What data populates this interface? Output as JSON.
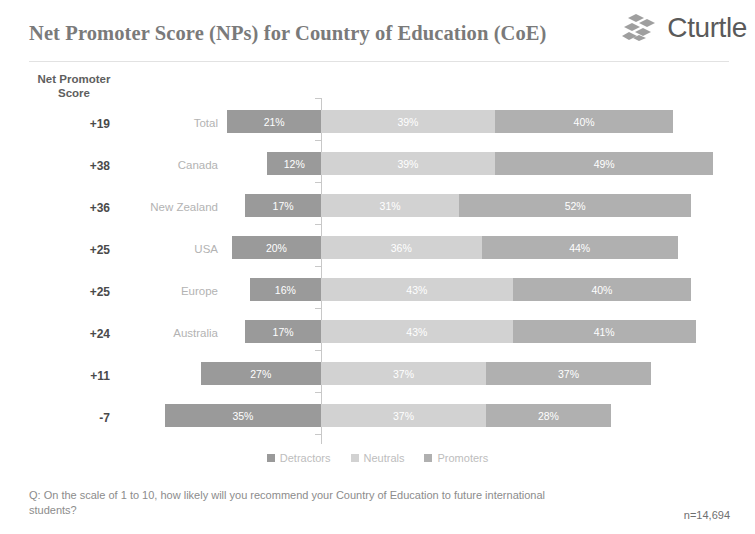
{
  "header": {
    "title": "Net Promoter Score (NPs) for Country of Education (CoE)",
    "logo_text": "Cturtle",
    "logo_icon": "diamond-cluster-icon"
  },
  "axis_caption": "Net Promoter\nScore",
  "footer": {
    "question": "Q: On the scale of 1 to 10, how likely will you recommend your Country of Education to future international students?",
    "sample_size": "n=14,694"
  },
  "colors": {
    "detractors": "#9a9a9a",
    "neutrals": "#d2d2d2",
    "promoters": "#b0b0b0",
    "axis": "#c8c8c8",
    "title": "#7a7a7a",
    "row_label": "#b3b3b3",
    "score": "#4a4a4a"
  },
  "chart_data": {
    "type": "bar",
    "subtype": "diverging-stacked-bar",
    "title": "Net Promoter Score (NPs) for Country of Education (CoE)",
    "xlabel": "",
    "ylabel": "Net Promoter Score",
    "grid": false,
    "legend_position": "bottom",
    "xlim": [
      -40,
      55
    ],
    "axis_origin": "Detractors extend left of zero line; Neutrals and Promoters extend right",
    "categories": [
      "Total",
      "Canada",
      "New Zealand",
      "USA",
      "Europe",
      "Australia",
      "UK",
      "Other"
    ],
    "nps_scores": [
      "+19",
      "+38",
      "+36",
      "+25",
      "+25",
      "+24",
      "+11",
      "-7"
    ],
    "series": [
      {
        "name": "Detractors",
        "color": "#9a9a9a",
        "values": [
          21,
          12,
          17,
          20,
          16,
          17,
          27,
          35
        ],
        "labels": [
          "21%",
          "12%",
          "17%",
          "20%",
          "16%",
          "17%",
          "27%",
          "35%"
        ]
      },
      {
        "name": "Neutrals",
        "color": "#d2d2d2",
        "values": [
          39,
          39,
          31,
          36,
          43,
          43,
          37,
          37
        ],
        "labels": [
          "39%",
          "39%",
          "31%",
          "36%",
          "43%",
          "43%",
          "37%",
          "37%"
        ]
      },
      {
        "name": "Promoters",
        "color": "#b0b0b0",
        "values": [
          40,
          49,
          52,
          44,
          40,
          41,
          37,
          28
        ],
        "labels": [
          "40%",
          "49%",
          "52%",
          "44%",
          "40%",
          "41%",
          "37%",
          "28%"
        ]
      }
    ],
    "rows": [
      {
        "score": "+19",
        "label": "Total",
        "detractors": 21,
        "neutrals": 39,
        "promoters": 40,
        "detractors_label": "21%",
        "neutrals_label": "39%",
        "promoters_label": "40%"
      },
      {
        "score": "+38",
        "label": "Canada",
        "detractors": 12,
        "neutrals": 39,
        "promoters": 49,
        "detractors_label": "12%",
        "neutrals_label": "39%",
        "promoters_label": "49%"
      },
      {
        "score": "+36",
        "label": "New Zealand",
        "detractors": 17,
        "neutrals": 31,
        "promoters": 52,
        "detractors_label": "17%",
        "neutrals_label": "31%",
        "promoters_label": "52%"
      },
      {
        "score": "+25",
        "label": "USA",
        "detractors": 20,
        "neutrals": 36,
        "promoters": 44,
        "detractors_label": "20%",
        "neutrals_label": "36%",
        "promoters_label": "44%"
      },
      {
        "score": "+25",
        "label": "Europe",
        "detractors": 16,
        "neutrals": 43,
        "promoters": 40,
        "detractors_label": "16%",
        "neutrals_label": "43%",
        "promoters_label": "40%"
      },
      {
        "score": "+24",
        "label": "Australia",
        "detractors": 17,
        "neutrals": 43,
        "promoters": 41,
        "detractors_label": "17%",
        "neutrals_label": "43%",
        "promoters_label": "41%"
      },
      {
        "score": "+11",
        "label": "UK",
        "detractors": 27,
        "neutrals": 37,
        "promoters": 37,
        "detractors_label": "27%",
        "neutrals_label": "37%",
        "promoters_label": "37%"
      },
      {
        "score": "-7",
        "label": "Other",
        "detractors": 35,
        "neutrals": 37,
        "promoters": 28,
        "detractors_label": "35%",
        "neutrals_label": "37%",
        "promoters_label": "28%"
      }
    ],
    "legend": [
      {
        "label": "Detractors",
        "color": "#9a9a9a"
      },
      {
        "label": "Neutrals",
        "color": "#d2d2d2"
      },
      {
        "label": "Promoters",
        "color": "#b0b0b0"
      }
    ]
  }
}
